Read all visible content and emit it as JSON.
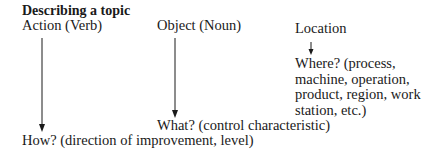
{
  "title": "Describing a topic",
  "columns": {
    "action": {
      "label": "Action (Verb)",
      "answer": "How? (direction of improvement, level)"
    },
    "object": {
      "label": "Object (Noun)",
      "answer": "What? (control characteristic)"
    },
    "location": {
      "label": "Location",
      "answer": "Where? (process, machine, operation, product, region, work station, etc.)"
    }
  },
  "colors": {
    "ink": "#1a1a1a",
    "background": "#ffffff"
  }
}
